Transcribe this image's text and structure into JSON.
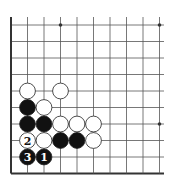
{
  "diagram": {
    "type": "go-board-fragment",
    "grid": {
      "columns": 10,
      "rows": 10,
      "origin_x": 11,
      "origin_y": 25,
      "spacing": 16.5,
      "right_extent": 164,
      "left_edge_thick": true,
      "bottom_edge_thick": true
    },
    "colors": {
      "background": "#ffffff",
      "line": "#555555",
      "edge": "#333333",
      "black_stone": "#111111",
      "white_stone": "#ffffff",
      "stone_outline": "#222222"
    },
    "star_points": [
      {
        "col": 3,
        "row": 0
      },
      {
        "col": 9,
        "row": 0
      },
      {
        "col": 9,
        "row": 6
      }
    ],
    "stones": [
      {
        "col": 1,
        "row": 4,
        "color": "white",
        "label": ""
      },
      {
        "col": 3,
        "row": 4,
        "color": "white",
        "label": ""
      },
      {
        "col": 1,
        "row": 5,
        "color": "black",
        "label": ""
      },
      {
        "col": 2,
        "row": 5,
        "color": "white",
        "label": ""
      },
      {
        "col": 1,
        "row": 6,
        "color": "black",
        "label": ""
      },
      {
        "col": 2,
        "row": 6,
        "color": "black",
        "label": ""
      },
      {
        "col": 3,
        "row": 6,
        "color": "white",
        "label": ""
      },
      {
        "col": 4,
        "row": 6,
        "color": "white",
        "label": ""
      },
      {
        "col": 5,
        "row": 6,
        "color": "white",
        "label": ""
      },
      {
        "col": 1,
        "row": 7,
        "color": "white",
        "label": "2"
      },
      {
        "col": 2,
        "row": 7,
        "color": "white",
        "label": ""
      },
      {
        "col": 3,
        "row": 7,
        "color": "black",
        "label": ""
      },
      {
        "col": 4,
        "row": 7,
        "color": "black",
        "label": ""
      },
      {
        "col": 5,
        "row": 7,
        "color": "white",
        "label": ""
      },
      {
        "col": 1,
        "row": 8,
        "color": "black",
        "label": "3"
      },
      {
        "col": 2,
        "row": 8,
        "color": "black",
        "label": "1"
      }
    ],
    "move_labels": [
      "1",
      "2",
      "3"
    ]
  }
}
